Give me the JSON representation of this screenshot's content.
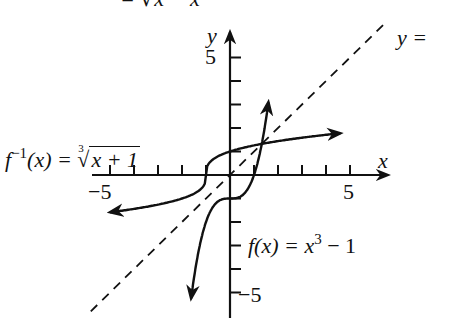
{
  "chart_data": {
    "type": "line",
    "title": "",
    "top_cropped_text": "= ∛x − x",
    "xlabel": "x",
    "ylabel": "y",
    "xlim": [
      -5.5,
      6
    ],
    "ylim": [
      -6,
      6
    ],
    "x_tick_labels": [
      "-5",
      "5"
    ],
    "y_tick_labels": [
      "5",
      "-5"
    ],
    "ticks_every": 1,
    "grid": false,
    "series": [
      {
        "name": "f(x) = x^3 - 1",
        "label": "f(x) = x³ − 1",
        "style": "solid",
        "arrows": "both",
        "x": [
          -1.6,
          -1.4,
          -1.2,
          -1.0,
          -0.8,
          -0.5,
          0,
          0.5,
          0.8,
          1.0,
          1.2,
          1.4,
          1.6
        ],
        "y": [
          -5.1,
          -3.74,
          -2.73,
          -2.0,
          -1.51,
          -1.13,
          -1.0,
          -0.88,
          -0.49,
          0.0,
          0.73,
          1.74,
          3.1
        ]
      },
      {
        "name": "f^-1(x) = cbrt(x + 1)",
        "label": "f⁻¹(x) = ∛(x + 1)",
        "style": "solid",
        "arrows": "both",
        "x": [
          -5,
          -3,
          -2,
          -1.5,
          -1,
          -0.5,
          0,
          1,
          2,
          3,
          4.5
        ],
        "y": [
          -1.59,
          -1.26,
          -1.0,
          -0.79,
          0.0,
          0.79,
          1.0,
          1.26,
          1.44,
          1.59,
          1.76
        ]
      },
      {
        "name": "y = x",
        "label": "y = x",
        "style": "dashed",
        "x": [
          -5.8,
          6.5
        ],
        "y": [
          -5.8,
          6.5
        ]
      }
    ],
    "annotations": [
      {
        "text": "f⁻¹(x) = ∛(x + 1)",
        "position": "left, above x-axis"
      },
      {
        "text": "f(x) = x³ − 1",
        "position": "right of y-axis, below x-axis"
      },
      {
        "text": "y = x",
        "position": "top right (cropped)"
      }
    ]
  },
  "labels": {
    "top_text": "= ∛x − x",
    "y_axis": "y",
    "x_axis": "x",
    "y_tick_pos": "5",
    "y_tick_neg": "−5",
    "x_tick_neg": "−5",
    "x_tick_pos": "5",
    "identity_line": "y = ",
    "finv_prefix": "f",
    "finv_sup": "−1",
    "finv_mid": "(x) = ",
    "finv_idx": "3",
    "finv_radicand": "x + 1",
    "f_prefix": "f(x) = x",
    "f_sup": "3",
    "f_suffix": " − 1"
  }
}
